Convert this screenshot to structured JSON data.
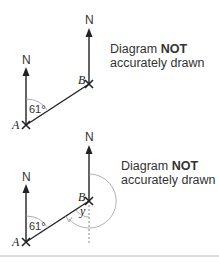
{
  "diagram1": {
    "north_label_a": "N",
    "north_label_b": "N",
    "point_a": "A",
    "point_b": "B",
    "angle_label": "61°",
    "note_line1_prefix": "Diagram ",
    "note_line1_bold": "NOT",
    "note_line2": "accurately drawn"
  },
  "diagram2": {
    "north_label_a": "N",
    "north_label_b": "N",
    "point_a": "A",
    "point_b": "B",
    "angle_label": "61°",
    "angle_y_label": "y",
    "note_line1_prefix": "Diagram ",
    "note_line1_bold": "NOT",
    "note_line2": "accurately drawn"
  },
  "colors": {
    "line": "#222222",
    "arc": "#9a9a9a",
    "divider": "#d0d0d0"
  }
}
